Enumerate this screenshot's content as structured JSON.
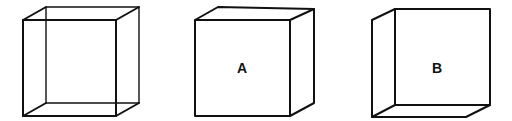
{
  "diagram": {
    "type": "necker-cube-illustration",
    "cubes": [
      {
        "id": "necker",
        "label": "",
        "style": "wireframe",
        "front": {
          "x1": 23,
          "y1": 20,
          "x2": 116,
          "y2": 116
        },
        "back": {
          "x1": 46,
          "y1": 7,
          "x2": 139,
          "y2": 103
        }
      },
      {
        "id": "A",
        "label": "A",
        "style": "solid",
        "label_pos": {
          "x": 242,
          "y": 73
        }
      },
      {
        "id": "B",
        "label": "B",
        "style": "solid",
        "label_pos": {
          "x": 437,
          "y": 73
        }
      }
    ],
    "colors": {
      "line": "#111111",
      "background": "#ffffff"
    }
  }
}
